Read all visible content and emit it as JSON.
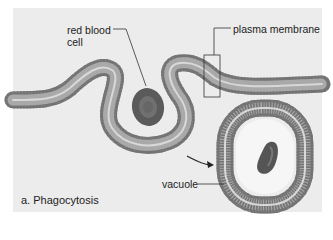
{
  "figure": {
    "caption": "a. Phagocytosis",
    "labels": {
      "red_blood_cell_line1": "red blood",
      "red_blood_cell_line2": "cell",
      "plasma_membrane": "plasma membrane",
      "vacuole": "vacuole"
    },
    "colors": {
      "background": "#ececec",
      "membrane_outer": "#7d7d7d",
      "membrane_inner": "#b8b8b8",
      "cell": "#5e5e5e",
      "leader_line": "#333333"
    }
  }
}
